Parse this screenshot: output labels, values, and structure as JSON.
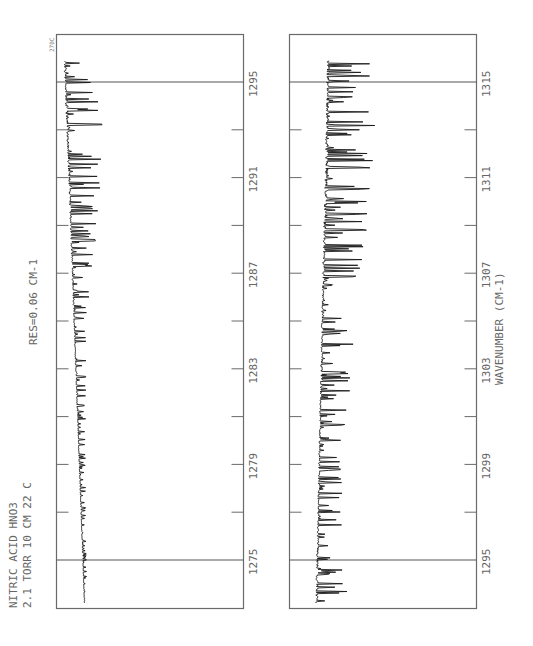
{
  "chart_data": {
    "type": "line",
    "title": "NITRIC ACID  HNO3",
    "subtitle": "2.1 TORR  10 CM  22 C",
    "annotations": [
      "RES=0.06 CM-1",
      "270C"
    ],
    "xlabel": "WAVENUMBER (CM-1)",
    "ylabel": "",
    "orientation": "rotated 90 degrees (wavenumber runs bottom-to-top)",
    "panels": [
      {
        "name": "left",
        "xlim": [
          1273.0,
          1296.0
        ],
        "tick_labels": [
          "1275",
          "1279",
          "1283",
          "1287",
          "1291",
          "1295"
        ],
        "tick_values": [
          1275,
          1279,
          1283,
          1287,
          1291,
          1295
        ],
        "minor_ticks": [
          1277,
          1281,
          1285,
          1289,
          1293
        ],
        "reference_lines": [
          1275,
          1295
        ],
        "series": [
          {
            "name": "HNO3 transmittance 1273-1296",
            "description": "Weak irregular absorption near 1275, increasing to strong regular P/R-branch line series near 1287-1296",
            "amplitude_profile": [
              {
                "x": 1273.5,
                "amp": 0.05
              },
              {
                "x": 1277,
                "amp": 0.08
              },
              {
                "x": 1281,
                "amp": 0.14
              },
              {
                "x": 1285,
                "amp": 0.22
              },
              {
                "x": 1289,
                "amp": 0.45
              },
              {
                "x": 1292,
                "amp": 0.6
              },
              {
                "x": 1294,
                "amp": 0.62
              },
              {
                "x": 1296,
                "amp": 0.45
              }
            ]
          }
        ]
      },
      {
        "name": "right",
        "xlim": [
          1293.0,
          1316.0
        ],
        "tick_labels": [
          "1295",
          "1299",
          "1303",
          "1307",
          "1311",
          "1315"
        ],
        "tick_values": [
          1295,
          1299,
          1303,
          1307,
          1311,
          1315
        ],
        "minor_ticks": [
          1297,
          1301,
          1305,
          1309,
          1313
        ],
        "reference_lines": [
          1295,
          1315
        ],
        "series": [
          {
            "name": "HNO3 transmittance 1293-1316",
            "description": "Regular line series near 1293-1297, dense Q-branch-like cluster near 1302-1304, strong absorption 1307-1316",
            "amplitude_profile": [
              {
                "x": 1293.5,
                "amp": 0.55
              },
              {
                "x": 1297,
                "amp": 0.4
              },
              {
                "x": 1300,
                "amp": 0.4
              },
              {
                "x": 1303,
                "amp": 0.55
              },
              {
                "x": 1306,
                "amp": 0.55
              },
              {
                "x": 1309,
                "amp": 0.75
              },
              {
                "x": 1312,
                "amp": 0.85
              },
              {
                "x": 1315.5,
                "amp": 0.75
              }
            ]
          }
        ]
      }
    ]
  },
  "labels": {
    "title_line1": "NITRIC ACID  HNO3",
    "title_line2": "2.1 TORR  10 CM  22 C",
    "resolution": "RES=0.06 CM-1",
    "corner_tag": "270C",
    "axis_label": "WAVENUMBER (CM-1)",
    "left_ticks": [
      "1275",
      "1279",
      "1283",
      "1287",
      "1291",
      "1295"
    ],
    "right_ticks": [
      "1295",
      "1299",
      "1303",
      "1307",
      "1311",
      "1315"
    ]
  }
}
